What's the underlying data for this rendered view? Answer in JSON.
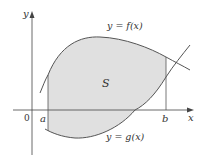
{
  "diagram": {
    "axes": {
      "x_label": "x",
      "y_label": "y",
      "origin_label": "0"
    },
    "bounds": {
      "left_label": "a",
      "right_label": "b"
    },
    "curves": {
      "upper_label": "y = f(x)",
      "lower_label": "y = g(x)"
    },
    "region": {
      "label": "S",
      "fill_color": "#e0e0e0"
    },
    "colors": {
      "stroke": "#555555",
      "axis": "#444444",
      "text": "#333333"
    }
  }
}
